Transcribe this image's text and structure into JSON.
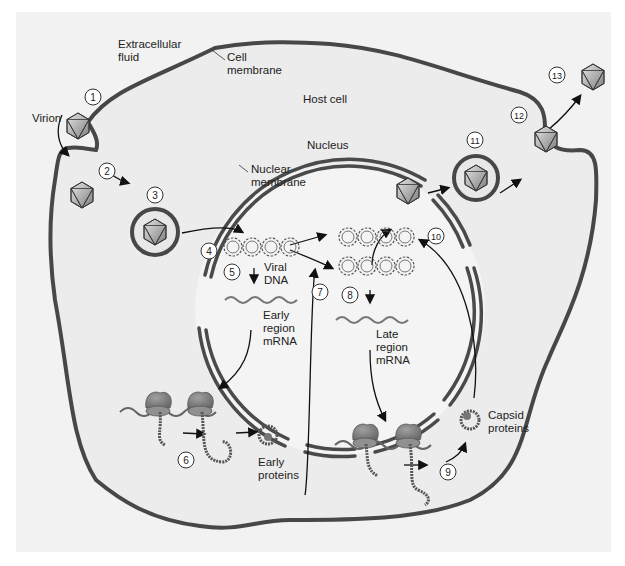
{
  "diagram": {
    "colors": {
      "background": "#ffffff",
      "panel": "#f1f1f1",
      "cytoplasm": "#ececec",
      "membrane": "#4a4a4a",
      "nucleus_fill": "#f3f3f3",
      "virion_fill": "#a9a9a9",
      "ribosome": "#8a8a8a",
      "protein": "#5a5a5a",
      "text": "#222222"
    },
    "labels": {
      "extracellular_fluid": [
        "Extracellular",
        "fluid"
      ],
      "cell_membrane": [
        "Cell",
        "membrane"
      ],
      "host_cell": "Host cell",
      "virion": "Virion",
      "nucleus": "Nucleus",
      "nuclear_membrane": [
        "Nuclear",
        "membrane"
      ],
      "viral_dna": [
        "Viral",
        "DNA"
      ],
      "early_mrna": [
        "Early",
        "region",
        "mRNA"
      ],
      "late_mrna": [
        "Late",
        "region",
        "mRNA"
      ],
      "early_proteins": [
        "Early",
        "proteins"
      ],
      "capsid_proteins": [
        "Capsid",
        "proteins"
      ]
    },
    "steps": [
      "1",
      "2",
      "3",
      "4",
      "5",
      "6",
      "7",
      "8",
      "9",
      "10",
      "11",
      "12",
      "13"
    ]
  }
}
